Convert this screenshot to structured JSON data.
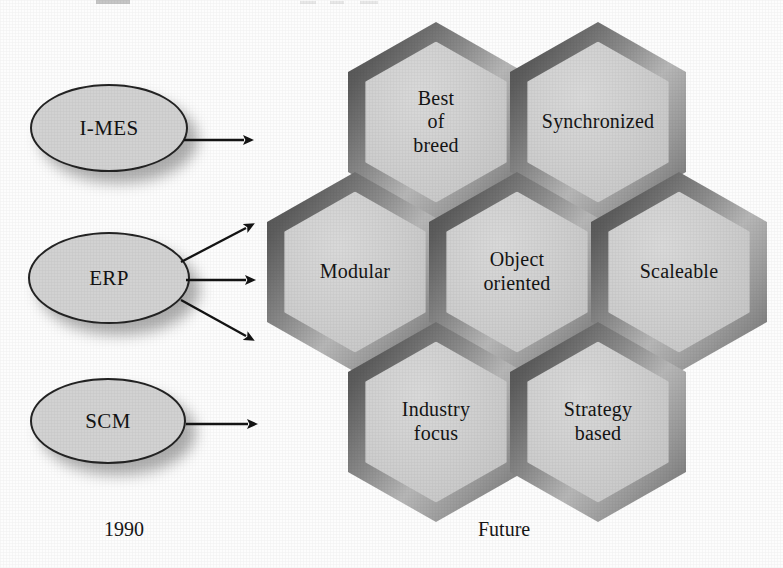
{
  "diagram": {
    "type": "transition-diagram"
  },
  "legacy": {
    "caption": "1990",
    "nodes": [
      {
        "id": "i-mes",
        "label": "I-MES"
      },
      {
        "id": "erp",
        "label": "ERP"
      },
      {
        "id": "scm",
        "label": "SCM"
      }
    ]
  },
  "future": {
    "caption": "Future",
    "hexagons": [
      {
        "id": "best-of-breed",
        "line1": "Best",
        "line2": "of",
        "line3": "breed"
      },
      {
        "id": "synchronized",
        "line1": "Synchronized",
        "line2": "",
        "line3": ""
      },
      {
        "id": "modular",
        "line1": "Modular",
        "line2": "",
        "line3": ""
      },
      {
        "id": "object-oriented",
        "line1": "Object",
        "line2": "oriented",
        "line3": ""
      },
      {
        "id": "scaleable",
        "line1": "Scaleable",
        "line2": "",
        "line3": ""
      },
      {
        "id": "industry-focus",
        "line1": "Industry",
        "line2": "focus",
        "line3": ""
      },
      {
        "id": "strategy-based",
        "line1": "Strategy",
        "line2": "based",
        "line3": ""
      }
    ]
  },
  "arrows": {
    "count": 5,
    "description": "arrows from legacy ellipses pointing right toward the honeycomb"
  },
  "colors": {
    "hex_face": "#cfcfcf",
    "hex_bevel_dark": "#4e4e4e",
    "hex_bevel_light": "#b7b7b7",
    "ellipse_fill": "#d2d2d2",
    "ellipse_stroke": "#232323",
    "arrow": "#141414",
    "text": "#141414",
    "background": "#fdfdfd"
  }
}
